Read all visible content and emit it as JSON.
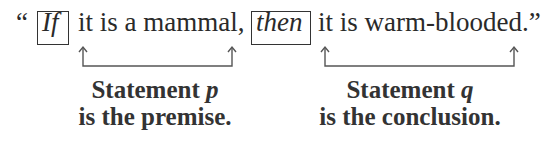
{
  "sentence": {
    "open_quote": "“",
    "if_keyword": "If",
    "premise_clause": "it is a mammal,",
    "then_keyword": "then",
    "conclusion_clause": "it is warm-blooded.”"
  },
  "labels": {
    "premise": {
      "line1_prefix": "Statement ",
      "variable": "p",
      "line2": "is the premise."
    },
    "conclusion": {
      "line1_prefix": "Statement ",
      "variable": "q",
      "line2": "is the conclusion."
    }
  },
  "colors": {
    "text": "#2a2a2a",
    "arrow": "#555555",
    "box": "#333333"
  }
}
